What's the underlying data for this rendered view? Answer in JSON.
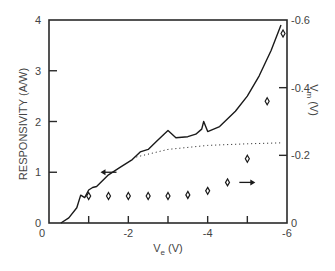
{
  "chart_data": {
    "type": "line",
    "title": "",
    "xlabel": "V_e (V)",
    "xlabel_main": "V",
    "xlabel_sub": "e",
    "xlabel_unit": "(V)",
    "ylabel": "RESPONSIVITY (A/W)",
    "y2label": "V_m (V)",
    "y2label_main": "V",
    "y2label_sub": "m",
    "y2label_unit": "(V)",
    "xlim": [
      0,
      -6
    ],
    "ylim": [
      0,
      4
    ],
    "y2lim": [
      0,
      -0.6
    ],
    "x_ticks": [
      0,
      -1,
      -2,
      -3,
      -4,
      -5,
      -6
    ],
    "x_tick_labels": [
      "0",
      "-2",
      "-4",
      "-6"
    ],
    "x_tick_label_values": [
      0,
      -2,
      -4,
      -6
    ],
    "y_tick_labels": [
      "0",
      "1",
      "2",
      "3",
      "4"
    ],
    "y_tick_values": [
      0,
      1,
      2,
      3,
      4
    ],
    "y2_tick_labels": [
      "0",
      "-0.2",
      "-0.4",
      "-0.6"
    ],
    "y2_tick_values": [
      0,
      -0.2,
      -0.4,
      -0.6
    ],
    "grid": false,
    "series": [
      {
        "name": "Responsivity",
        "axis": "left",
        "style": "solid",
        "x": [
          -0.3,
          -0.5,
          -0.7,
          -0.8,
          -0.9,
          -1.0,
          -1.1,
          -1.2,
          -1.5,
          -1.8,
          -2.1,
          -2.3,
          -2.5,
          -2.7,
          -2.9,
          -3.0,
          -3.2,
          -3.5,
          -3.7,
          -3.85,
          -3.9,
          -4.0,
          -4.3,
          -4.7,
          -5.0,
          -5.3,
          -5.6,
          -5.85
        ],
        "values": [
          0,
          0.1,
          0.3,
          0.55,
          0.5,
          0.65,
          0.7,
          0.72,
          0.95,
          1.1,
          1.25,
          1.4,
          1.45,
          1.6,
          1.75,
          1.82,
          1.68,
          1.7,
          1.75,
          1.85,
          2.0,
          1.8,
          1.9,
          2.2,
          2.5,
          2.9,
          3.4,
          3.9
        ]
      },
      {
        "name": "Responsivity extrapolation",
        "axis": "left",
        "style": "dotted",
        "x": [
          -2.2,
          -3.0,
          -4.0,
          -5.0,
          -5.9
        ],
        "values": [
          1.3,
          1.45,
          1.53,
          1.56,
          1.58
        ]
      },
      {
        "name": "V_m",
        "axis": "right",
        "style": "diamond-markers",
        "x": [
          -1.0,
          -1.5,
          -2.0,
          -2.5,
          -3.0,
          -3.5,
          -4.0,
          -4.5,
          -5.0,
          -5.5,
          -5.9
        ],
        "values": [
          -0.08,
          -0.08,
          -0.08,
          -0.08,
          -0.08,
          -0.083,
          -0.095,
          -0.12,
          -0.19,
          -0.36,
          -0.56
        ]
      }
    ],
    "annotations": [
      {
        "type": "arrow",
        "direction": "left",
        "x": -1.5,
        "y": 1.0,
        "axis": "left",
        "meaning": "curve refers to left axis"
      },
      {
        "type": "arrow",
        "direction": "right",
        "x": -5.0,
        "y": -0.12,
        "axis": "right",
        "meaning": "markers refer to right axis"
      }
    ]
  },
  "colors": {
    "line": "#1a1a1a",
    "axis": "#2a2a2a",
    "text": "#444444",
    "background": "#ffffff"
  }
}
